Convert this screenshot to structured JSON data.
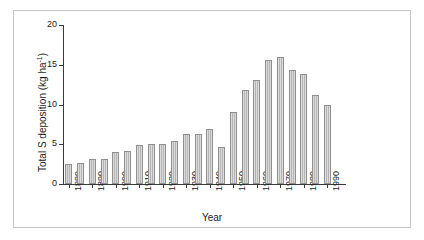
{
  "chart_data": {
    "type": "bar",
    "title": "",
    "xlabel": "Year",
    "ylabel": "Total S deposition (kg ha⁻¹)",
    "ylim": [
      0,
      20
    ],
    "xlim": [
      1877.5,
      1997.5
    ],
    "ytick_labels": [
      "0",
      "5",
      "10",
      "15",
      "20"
    ],
    "ytick_values": [
      0,
      5,
      10,
      15,
      20
    ],
    "xtick_labels": [
      "1880",
      "1890",
      "1900",
      "1910",
      "1920",
      "1930",
      "1940",
      "1950",
      "1960",
      "1970",
      "1980",
      "1990"
    ],
    "xtick_values": [
      1880,
      1890,
      1900,
      1910,
      1920,
      1930,
      1940,
      1950,
      1960,
      1970,
      1980,
      1990
    ],
    "grid": false,
    "legend": false,
    "bar_color": "#b3b3b3",
    "bar_edge_color": "#8f8f8f",
    "axis_color": "#3a3a3a",
    "frame_color": "#c6c6c6",
    "categories": [
      1880,
      1885,
      1890,
      1895,
      1900,
      1905,
      1910,
      1915,
      1920,
      1925,
      1930,
      1935,
      1940,
      1945,
      1950,
      1955,
      1960,
      1965,
      1970,
      1975,
      1980,
      1985,
      1990,
      1995
    ],
    "values": [
      2.5,
      2.6,
      3.1,
      3.2,
      4.0,
      4.1,
      4.9,
      5.0,
      5.0,
      5.4,
      6.3,
      6.3,
      6.9,
      4.6,
      9.0,
      11.8,
      13.1,
      15.6,
      16.0,
      14.4,
      13.8,
      11.2,
      10.0,
      0
    ]
  },
  "axis": {
    "ylabel_main": "Total S deposition (kg ha",
    "ylabel_sup": "-1",
    "ylabel_close": ")",
    "xlabel": "Year"
  }
}
